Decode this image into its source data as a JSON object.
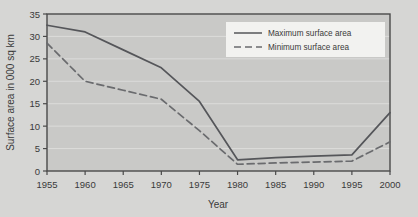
{
  "chart_data": {
    "type": "line",
    "title": "",
    "xlabel": "Year",
    "ylabel": "Surface area in 000 sq km",
    "x": [
      1955,
      1960,
      1965,
      1970,
      1975,
      1980,
      1985,
      1990,
      1995,
      2000
    ],
    "xtick_labels": [
      "1955",
      "1960",
      "1965",
      "1970",
      "1975",
      "1980",
      "1985",
      "1990",
      "1995",
      "2000"
    ],
    "ytick_labels": [
      "0",
      "5",
      "10",
      "15",
      "20",
      "25",
      "30",
      "35"
    ],
    "yticks": [
      0,
      5,
      10,
      15,
      20,
      25,
      30,
      35
    ],
    "xlim": [
      1955,
      2000
    ],
    "ylim": [
      0,
      35
    ],
    "grid": true,
    "legend_position": "top-right",
    "series": [
      {
        "name": "Maximum surface area",
        "style": "solid",
        "color": "#55565a",
        "values": [
          32.5,
          31.0,
          27.0,
          23.0,
          15.5,
          2.5,
          3.0,
          3.3,
          3.6,
          13.0
        ]
      },
      {
        "name": "Minimum surface area",
        "style": "dashed",
        "color": "#6a6b6e",
        "values": [
          28.5,
          20.0,
          18.0,
          16.0,
          9.0,
          1.5,
          1.8,
          2.0,
          2.2,
          6.5
        ]
      }
    ]
  },
  "legend": {
    "items": [
      {
        "label": "Maximum surface area"
      },
      {
        "label": "Minimum surface area"
      }
    ]
  },
  "colors": {
    "page_background": "#d6d6d4",
    "plot_background": "#c9c9c7",
    "frame": "#4a4a4a",
    "gridline": "#dcdcda",
    "text": "#3a3a3a",
    "legend_background": "#f2f2f0"
  }
}
